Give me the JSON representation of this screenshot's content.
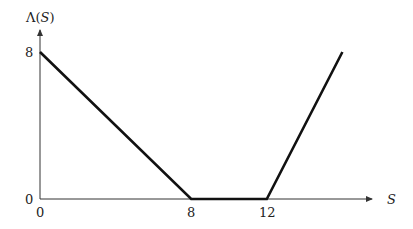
{
  "chart_data": {
    "type": "line",
    "title": "",
    "xlabel": "S",
    "ylabel": "Λ(S)",
    "x": [
      0,
      8,
      12,
      16
    ],
    "series": [
      {
        "name": "Λ(S)",
        "values": [
          8,
          0,
          0,
          8
        ]
      }
    ],
    "xticks": [
      "0",
      "8",
      "12"
    ],
    "yticks": [
      "0",
      "8"
    ],
    "xlim": [
      0,
      18.5
    ],
    "ylim": [
      0,
      9
    ],
    "grid": false,
    "legend": "none"
  },
  "labels": {
    "y_axis_label_prefix": "Λ(",
    "y_axis_label_var": "S",
    "y_axis_label_suffix": ")",
    "x_axis_label": "S",
    "ytick_8": "8",
    "ytick_0": "0",
    "xtick_0": "0",
    "xtick_8": "8",
    "xtick_12": "12"
  },
  "colors": {
    "line": "#111111",
    "axis": "#333333"
  }
}
